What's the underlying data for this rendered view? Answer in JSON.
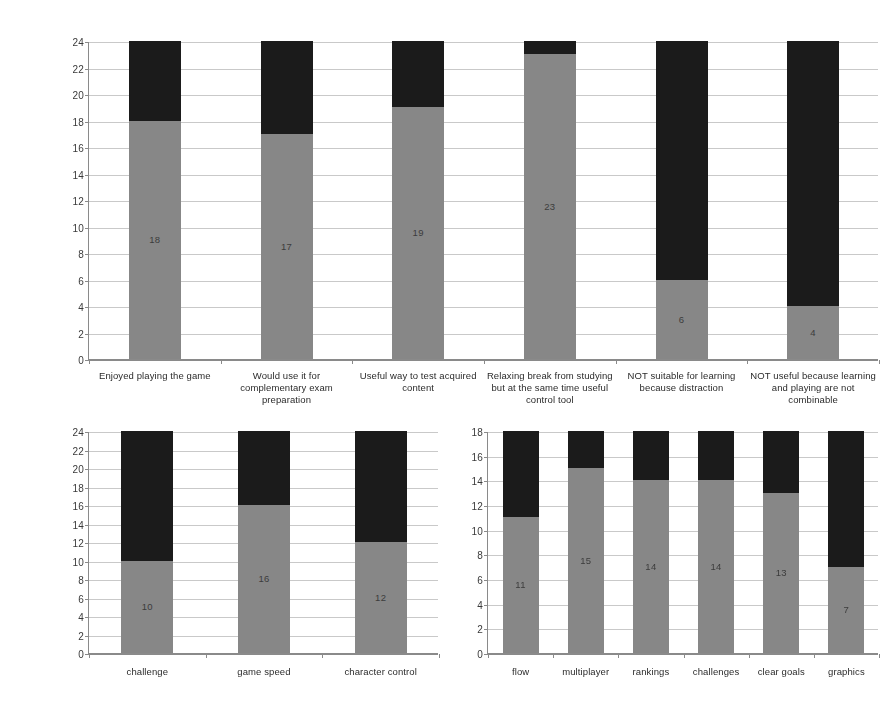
{
  "colors": {
    "series_agree": "#878787",
    "series_disagree": "#1b1b1b",
    "gridline": "#c9c9c9",
    "axis": "#8a8a8a",
    "background": "#ffffff"
  },
  "chart_data": [
    {
      "id": "chart-top",
      "type": "bar",
      "stacked": true,
      "title": "",
      "xlabel": "",
      "ylabel": "",
      "ylim": [
        0,
        24
      ],
      "ytick_step": 2,
      "yticks": [
        "0",
        "2",
        "4",
        "6",
        "8",
        "10",
        "12",
        "14",
        "16",
        "18",
        "20",
        "22",
        "24"
      ],
      "grid": true,
      "legend": "none",
      "categories": [
        "Enjoyed playing the game",
        "Would use it for complementary exam preparation",
        "Useful way to test acquired content",
        "Relaxing break from studying but at the same time useful control tool",
        "NOT suitable for learning because distraction",
        "NOT useful because learning and playing are not combinable"
      ],
      "series": [
        {
          "name": "agree",
          "color": "#878787",
          "values": [
            18,
            17,
            19,
            23,
            6,
            4
          ]
        },
        {
          "name": "disagree",
          "color": "#1b1b1b",
          "values": [
            6,
            7,
            5,
            1,
            18,
            20
          ]
        }
      ],
      "data_labels_bottom": [
        "18",
        "17",
        "19",
        "23",
        "6",
        "4"
      ],
      "data_labels_top": [
        "",
        "",
        "",
        "",
        "",
        ""
      ]
    },
    {
      "id": "chart-bottom-left",
      "type": "bar",
      "stacked": true,
      "title": "",
      "xlabel": "",
      "ylabel": "",
      "ylim": [
        0,
        24
      ],
      "ytick_step": 2,
      "yticks": [
        "0",
        "2",
        "4",
        "6",
        "8",
        "10",
        "12",
        "14",
        "16",
        "18",
        "20",
        "22",
        "24"
      ],
      "grid": true,
      "legend": "none",
      "categories": [
        "challenge",
        "game speed",
        "character control"
      ],
      "series": [
        {
          "name": "agree",
          "color": "#878787",
          "values": [
            10,
            16,
            12
          ]
        },
        {
          "name": "disagree",
          "color": "#1b1b1b",
          "values": [
            14,
            8,
            12
          ]
        }
      ],
      "data_labels_bottom": [
        "10",
        "16",
        "12"
      ],
      "data_labels_top": [
        "",
        "",
        ""
      ]
    },
    {
      "id": "chart-bottom-right",
      "type": "bar",
      "stacked": true,
      "title": "",
      "xlabel": "",
      "ylabel": "",
      "ylim": [
        0,
        18
      ],
      "ytick_step": 2,
      "yticks": [
        "0",
        "2",
        "4",
        "6",
        "8",
        "10",
        "12",
        "14",
        "16",
        "18"
      ],
      "grid": true,
      "legend": "none",
      "categories": [
        "flow",
        "multiplayer",
        "rankings",
        "challenges",
        "clear goals",
        "graphics"
      ],
      "series": [
        {
          "name": "agree",
          "color": "#878787",
          "values": [
            11,
            15,
            14,
            14,
            13,
            7
          ]
        },
        {
          "name": "disagree",
          "color": "#1b1b1b",
          "values": [
            7,
            3,
            4,
            4,
            5,
            11
          ]
        }
      ],
      "data_labels_bottom": [
        "11",
        "15",
        "14",
        "14",
        "13",
        "7"
      ],
      "data_labels_top": [
        "",
        "",
        "",
        "",
        "",
        ""
      ]
    }
  ]
}
